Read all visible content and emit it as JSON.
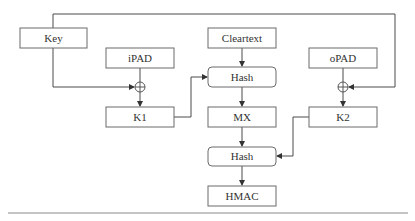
{
  "diagram": {
    "type": "flowchart",
    "nodes": {
      "key": {
        "label": "Key",
        "shape": "rect"
      },
      "ipad": {
        "label": "iPAD",
        "shape": "rect"
      },
      "xor1": {
        "label": "⊕",
        "shape": "xor-circle"
      },
      "k1": {
        "label": "K1",
        "shape": "rect"
      },
      "cleartext": {
        "label": "Cleartext",
        "shape": "rect"
      },
      "hash1": {
        "label": "Hash",
        "shape": "rounded-rect"
      },
      "mx": {
        "label": "MX",
        "shape": "rect"
      },
      "hash2": {
        "label": "Hash",
        "shape": "rounded-rect"
      },
      "hmac": {
        "label": "HMAC",
        "shape": "rect"
      },
      "opad": {
        "label": "oPAD",
        "shape": "rect"
      },
      "xor2": {
        "label": "⊕",
        "shape": "xor-circle"
      },
      "k2": {
        "label": "K2",
        "shape": "rect"
      }
    },
    "edges": [
      {
        "from": "Key",
        "to": "XOR1"
      },
      {
        "from": "Key",
        "to": "XOR2"
      },
      {
        "from": "iPAD",
        "to": "XOR1"
      },
      {
        "from": "XOR1",
        "to": "K1"
      },
      {
        "from": "K1",
        "to": "Hash (1)"
      },
      {
        "from": "Cleartext",
        "to": "Hash (1)"
      },
      {
        "from": "Hash (1)",
        "to": "MX"
      },
      {
        "from": "oPAD",
        "to": "XOR2"
      },
      {
        "from": "XOR2",
        "to": "K2"
      },
      {
        "from": "MX",
        "to": "Hash (2)"
      },
      {
        "from": "K2",
        "to": "Hash (2)"
      },
      {
        "from": "Hash (2)",
        "to": "HMAC"
      }
    ]
  }
}
